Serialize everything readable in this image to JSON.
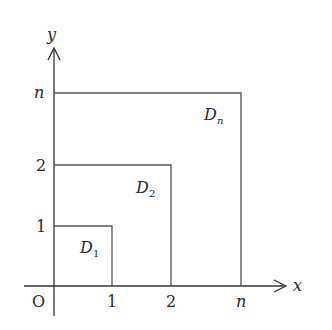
{
  "diagram": {
    "axes": {
      "x_label": "x",
      "y_label": "y",
      "origin_label": "O"
    },
    "x_ticks": [
      {
        "label": "1",
        "px": 112
      },
      {
        "label": "2",
        "px": 171
      },
      {
        "label": "n",
        "px": 241
      }
    ],
    "y_ticks": [
      {
        "label": "1",
        "py": 226
      },
      {
        "label": "2",
        "py": 165
      },
      {
        "label": "n",
        "py": 93
      }
    ],
    "regions": [
      {
        "name": "D",
        "sub": "1",
        "x": 112,
        "y": 226
      },
      {
        "name": "D",
        "sub": "2",
        "x": 171,
        "y": 165
      },
      {
        "name": "D",
        "sub": "n",
        "x": 241,
        "y": 93
      }
    ],
    "colors": {
      "axis": "#333333",
      "line": "#555555",
      "text": "#2a2a2a"
    }
  }
}
